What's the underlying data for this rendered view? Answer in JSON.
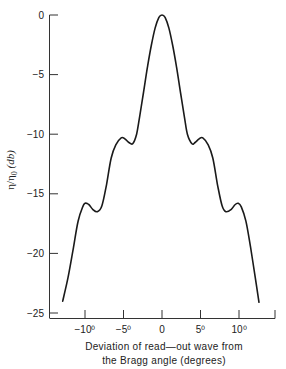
{
  "chart_data": {
    "type": "line",
    "title": "",
    "xlabel": "Deviation of read—out wave from the Bragg angle (degrees)",
    "xlabel_lines": [
      "Deviation of read—out wave from",
      "the Bragg angle (degrees)"
    ],
    "ylabel": "η/η₀ (db)",
    "ylabel_parts": {
      "main": "η/η",
      "sub": "0",
      "unit": " (db)"
    },
    "xlim": [
      -14.7,
      14.7
    ],
    "ylim": [
      -25,
      0
    ],
    "grid": false,
    "legend": null,
    "x_ticks": [
      {
        "value": -10,
        "label": "−10⁰"
      },
      {
        "value": -5,
        "label": "−5⁰"
      },
      {
        "value": 0,
        "label": "0"
      },
      {
        "value": 5,
        "label": "5⁰"
      },
      {
        "value": 10,
        "label": "10⁰"
      }
    ],
    "y_ticks": [
      {
        "value": 0,
        "label": "0"
      },
      {
        "value": -5,
        "label": "−5"
      },
      {
        "value": -10,
        "label": "−10"
      },
      {
        "value": -15,
        "label": "−15"
      },
      {
        "value": -20,
        "label": "−20"
      },
      {
        "value": -25,
        "label": "−25"
      }
    ],
    "series": [
      {
        "name": "diffraction efficiency",
        "x": [
          -12.9,
          -12.2,
          -11.5,
          -10.9,
          -10.3,
          -10.0,
          -9.5,
          -9.0,
          -8.4,
          -7.8,
          -7.2,
          -6.6,
          -6.0,
          -5.3,
          -4.8,
          -4.3,
          -3.8,
          -3.3,
          -2.9,
          -2.4,
          -1.9,
          -1.4,
          -0.9,
          -0.4,
          0.0,
          0.4,
          0.9,
          1.4,
          1.9,
          2.4,
          2.9,
          3.3,
          3.9,
          4.3,
          4.8,
          5.3,
          6.0,
          6.6,
          7.2,
          7.8,
          8.3,
          9.0,
          9.5,
          9.9,
          10.3,
          10.9,
          11.5,
          12.1,
          12.6
        ],
        "values": [
          -24.0,
          -22.0,
          -19.5,
          -17.3,
          -16.1,
          -15.8,
          -15.9,
          -16.3,
          -16.5,
          -16.0,
          -14.2,
          -12.0,
          -10.9,
          -10.3,
          -10.4,
          -10.7,
          -10.8,
          -10.0,
          -8.5,
          -6.5,
          -4.4,
          -2.6,
          -1.1,
          -0.2,
          0.0,
          -0.2,
          -1.1,
          -2.6,
          -4.4,
          -6.5,
          -8.5,
          -10.0,
          -10.8,
          -10.7,
          -10.4,
          -10.3,
          -10.9,
          -12.0,
          -14.2,
          -16.0,
          -16.5,
          -16.3,
          -15.9,
          -15.8,
          -16.1,
          -17.3,
          -19.5,
          -22.0,
          -24.1
        ],
        "color": "#1a1a1a"
      }
    ],
    "annotations": []
  }
}
